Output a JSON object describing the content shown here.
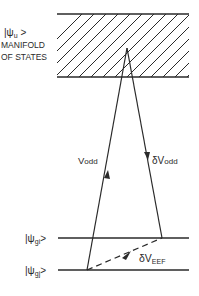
{
  "diagram": {
    "manifold_label": {
      "ket": "|ψ",
      "ket_sub": "u",
      "ket_close": " >",
      "line2": "MANIFOLD",
      "line3": "OF STATES"
    },
    "arrows": {
      "up": {
        "symbol": "V",
        "sub": "odd"
      },
      "down": {
        "symbol": "δV",
        "sub": "odd"
      },
      "dashed": {
        "symbol": "δV",
        "sub": "EEF"
      }
    },
    "levels": [
      {
        "ket": "|ψ",
        "sub": "gi",
        "close": ">"
      },
      {
        "ket": "|ψ",
        "sub": "gj",
        "close": ">"
      }
    ],
    "colors": {
      "ink": "#2a2a2a",
      "background": "#ffffff"
    }
  }
}
